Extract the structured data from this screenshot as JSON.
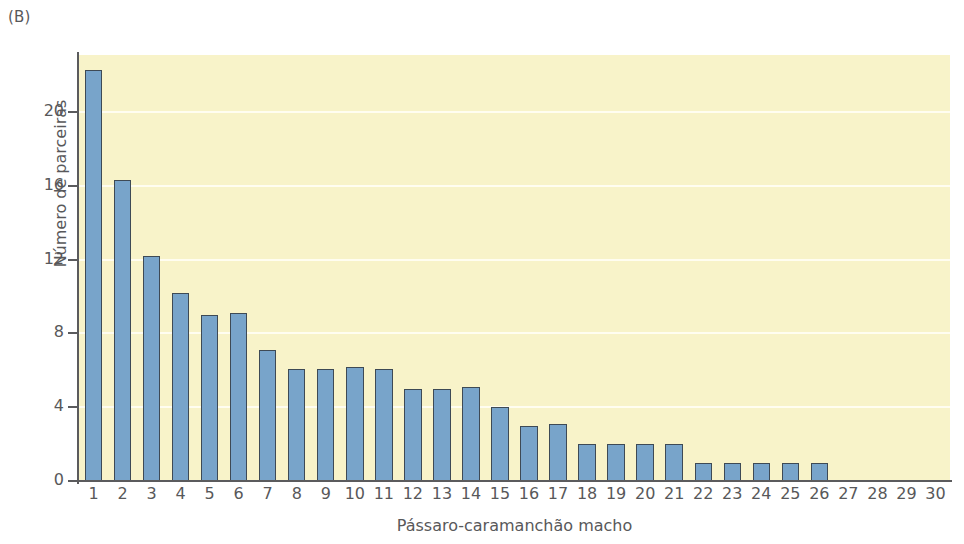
{
  "figure": {
    "panel_label": "(B)",
    "background_color": "#ffffff",
    "plot_background_color": "#f8f3c9",
    "bar_color": "#78a4ca",
    "bar_edge_color": "#3e4a55",
    "gridline_color": "#fffdf0",
    "axis_color": "#5b5b5d",
    "text_color": "#58585a"
  },
  "chart_data": {
    "type": "bar",
    "title": "",
    "xlabel": "Pássaro-caramanchão macho",
    "ylabel": "Número de parceiras",
    "categories": [
      "1",
      "2",
      "3",
      "4",
      "5",
      "6",
      "7",
      "8",
      "9",
      "10",
      "11",
      "12",
      "13",
      "14",
      "15",
      "16",
      "17",
      "18",
      "19",
      "20",
      "21",
      "22",
      "23",
      "24",
      "25",
      "26",
      "27",
      "28",
      "29",
      "30"
    ],
    "values": [
      22.3,
      16.3,
      12.2,
      10.2,
      9.0,
      9.1,
      7.1,
      6.1,
      6.1,
      6.2,
      6.1,
      5.0,
      5.0,
      5.1,
      4.0,
      3.0,
      3.1,
      2.0,
      2.0,
      2.0,
      2.0,
      1.0,
      1.0,
      1.0,
      1.0,
      1.0,
      0,
      0,
      0,
      0
    ],
    "ylim": [
      0,
      23.1
    ],
    "xlim": [
      0.5,
      30.5
    ],
    "yticks": [
      0,
      4,
      8,
      12,
      16,
      20
    ],
    "ytick_labels": [
      "0",
      "4",
      "8",
      "12",
      "16",
      "20"
    ],
    "grid": true,
    "grid_axis": "y",
    "legend": false,
    "legend_position": "none"
  }
}
